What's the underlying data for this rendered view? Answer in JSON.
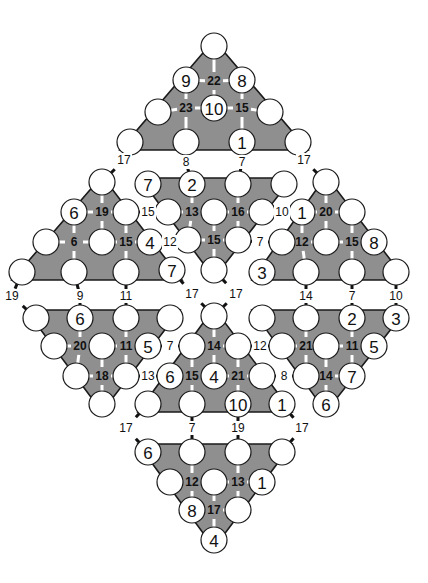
{
  "colors": {
    "shade": "#8f8f8f",
    "outline": "#1a1a1a",
    "circle": "#ffffff",
    "text": "#111111"
  },
  "triangles": [
    {
      "id": "top",
      "points": [
        [
          214,
          40
        ],
        [
          120,
          150
        ],
        [
          308,
          150
        ]
      ]
    },
    {
      "id": "mid-top",
      "points": [
        [
          140,
          178
        ],
        [
          292,
          178
        ],
        [
          214,
          278
        ]
      ]
    },
    {
      "id": "left",
      "points": [
        [
          102,
          176
        ],
        [
          12,
          280
        ],
        [
          182,
          280
        ]
      ]
    },
    {
      "id": "right",
      "points": [
        [
          326,
          176
        ],
        [
          252,
          280
        ],
        [
          406,
          280
        ]
      ]
    },
    {
      "id": "lower-left",
      "points": [
        [
          26,
          310
        ],
        [
          180,
          310
        ],
        [
          102,
          412
        ]
      ]
    },
    {
      "id": "lower-mid",
      "points": [
        [
          214,
          308
        ],
        [
          138,
          412
        ],
        [
          292,
          412
        ]
      ]
    },
    {
      "id": "lower-right",
      "points": [
        [
          252,
          310
        ],
        [
          406,
          310
        ],
        [
          326,
          412
        ]
      ]
    },
    {
      "id": "bottom",
      "points": [
        [
          138,
          444
        ],
        [
          292,
          444
        ],
        [
          214,
          548
        ]
      ]
    }
  ],
  "circles": [
    {
      "x": 214,
      "y": 46,
      "v": ""
    },
    {
      "x": 186,
      "y": 80,
      "v": "9"
    },
    {
      "x": 242,
      "y": 80,
      "v": "8"
    },
    {
      "x": 158,
      "y": 112,
      "v": ""
    },
    {
      "x": 214,
      "y": 108,
      "v": "10"
    },
    {
      "x": 270,
      "y": 112,
      "v": ""
    },
    {
      "x": 130,
      "y": 142,
      "v": ""
    },
    {
      "x": 186,
      "y": 142,
      "v": ""
    },
    {
      "x": 242,
      "y": 142,
      "v": "1"
    },
    {
      "x": 298,
      "y": 142,
      "v": ""
    },
    {
      "x": 148,
      "y": 184,
      "v": "7"
    },
    {
      "x": 192,
      "y": 184,
      "v": "2"
    },
    {
      "x": 238,
      "y": 184,
      "v": ""
    },
    {
      "x": 284,
      "y": 184,
      "v": ""
    },
    {
      "x": 168,
      "y": 212,
      "v": ""
    },
    {
      "x": 214,
      "y": 212,
      "v": ""
    },
    {
      "x": 262,
      "y": 212,
      "v": ""
    },
    {
      "x": 188,
      "y": 240,
      "v": ""
    },
    {
      "x": 238,
      "y": 240,
      "v": ""
    },
    {
      "x": 214,
      "y": 270,
      "v": ""
    },
    {
      "x": 102,
      "y": 182,
      "v": ""
    },
    {
      "x": 74,
      "y": 212,
      "v": "6"
    },
    {
      "x": 126,
      "y": 212,
      "v": ""
    },
    {
      "x": 46,
      "y": 242,
      "v": ""
    },
    {
      "x": 102,
      "y": 242,
      "v": ""
    },
    {
      "x": 150,
      "y": 242,
      "v": "4"
    },
    {
      "x": 22,
      "y": 272,
      "v": ""
    },
    {
      "x": 74,
      "y": 272,
      "v": ""
    },
    {
      "x": 126,
      "y": 272,
      "v": ""
    },
    {
      "x": 172,
      "y": 270,
      "v": "7"
    },
    {
      "x": 326,
      "y": 182,
      "v": ""
    },
    {
      "x": 302,
      "y": 212,
      "v": "1"
    },
    {
      "x": 352,
      "y": 212,
      "v": ""
    },
    {
      "x": 282,
      "y": 242,
      "v": ""
    },
    {
      "x": 326,
      "y": 242,
      "v": ""
    },
    {
      "x": 374,
      "y": 242,
      "v": "8"
    },
    {
      "x": 262,
      "y": 272,
      "v": "3"
    },
    {
      "x": 306,
      "y": 272,
      "v": ""
    },
    {
      "x": 352,
      "y": 272,
      "v": ""
    },
    {
      "x": 396,
      "y": 272,
      "v": ""
    },
    {
      "x": 36,
      "y": 318,
      "v": ""
    },
    {
      "x": 80,
      "y": 318,
      "v": "6"
    },
    {
      "x": 126,
      "y": 318,
      "v": ""
    },
    {
      "x": 170,
      "y": 318,
      "v": ""
    },
    {
      "x": 54,
      "y": 346,
      "v": ""
    },
    {
      "x": 102,
      "y": 346,
      "v": ""
    },
    {
      "x": 148,
      "y": 346,
      "v": "5"
    },
    {
      "x": 76,
      "y": 376,
      "v": ""
    },
    {
      "x": 126,
      "y": 376,
      "v": ""
    },
    {
      "x": 102,
      "y": 404,
      "v": ""
    },
    {
      "x": 214,
      "y": 316,
      "v": ""
    },
    {
      "x": 192,
      "y": 346,
      "v": ""
    },
    {
      "x": 238,
      "y": 346,
      "v": ""
    },
    {
      "x": 170,
      "y": 376,
      "v": "6"
    },
    {
      "x": 214,
      "y": 376,
      "v": "4"
    },
    {
      "x": 262,
      "y": 376,
      "v": ""
    },
    {
      "x": 148,
      "y": 404,
      "v": ""
    },
    {
      "x": 192,
      "y": 404,
      "v": ""
    },
    {
      "x": 238,
      "y": 404,
      "v": "10"
    },
    {
      "x": 282,
      "y": 404,
      "v": "1"
    },
    {
      "x": 262,
      "y": 318,
      "v": ""
    },
    {
      "x": 306,
      "y": 318,
      "v": ""
    },
    {
      "x": 352,
      "y": 318,
      "v": "2"
    },
    {
      "x": 396,
      "y": 318,
      "v": "3"
    },
    {
      "x": 282,
      "y": 346,
      "v": ""
    },
    {
      "x": 326,
      "y": 346,
      "v": ""
    },
    {
      "x": 374,
      "y": 346,
      "v": "5"
    },
    {
      "x": 306,
      "y": 376,
      "v": ""
    },
    {
      "x": 352,
      "y": 376,
      "v": "7"
    },
    {
      "x": 326,
      "y": 404,
      "v": "6"
    },
    {
      "x": 148,
      "y": 452,
      "v": "6"
    },
    {
      "x": 192,
      "y": 452,
      "v": ""
    },
    {
      "x": 238,
      "y": 452,
      "v": ""
    },
    {
      "x": 282,
      "y": 452,
      "v": ""
    },
    {
      "x": 170,
      "y": 482,
      "v": ""
    },
    {
      "x": 214,
      "y": 482,
      "v": ""
    },
    {
      "x": 262,
      "y": 482,
      "v": "1"
    },
    {
      "x": 192,
      "y": 510,
      "v": "8"
    },
    {
      "x": 238,
      "y": 510,
      "v": ""
    },
    {
      "x": 214,
      "y": 540,
      "v": "4"
    }
  ],
  "inner_sums": [
    {
      "x": 214,
      "y": 81,
      "v": "22"
    },
    {
      "x": 186,
      "y": 108,
      "v": "23"
    },
    {
      "x": 242,
      "y": 108,
      "v": "15"
    },
    {
      "x": 192,
      "y": 212,
      "v": "13"
    },
    {
      "x": 238,
      "y": 212,
      "v": "16"
    },
    {
      "x": 214,
      "y": 240,
      "v": "15"
    },
    {
      "x": 102,
      "y": 212,
      "v": "19"
    },
    {
      "x": 74,
      "y": 242,
      "v": "6"
    },
    {
      "x": 126,
      "y": 242,
      "v": "15"
    },
    {
      "x": 326,
      "y": 212,
      "v": "20"
    },
    {
      "x": 302,
      "y": 242,
      "v": "12"
    },
    {
      "x": 352,
      "y": 242,
      "v": "15"
    },
    {
      "x": 80,
      "y": 346,
      "v": "20"
    },
    {
      "x": 126,
      "y": 346,
      "v": "11"
    },
    {
      "x": 102,
      "y": 376,
      "v": "18"
    },
    {
      "x": 214,
      "y": 346,
      "v": "14"
    },
    {
      "x": 192,
      "y": 376,
      "v": "15"
    },
    {
      "x": 238,
      "y": 376,
      "v": "21"
    },
    {
      "x": 306,
      "y": 346,
      "v": "21"
    },
    {
      "x": 352,
      "y": 346,
      "v": "11"
    },
    {
      "x": 326,
      "y": 376,
      "v": "14"
    },
    {
      "x": 192,
      "y": 482,
      "v": "12"
    },
    {
      "x": 238,
      "y": 482,
      "v": "13"
    },
    {
      "x": 214,
      "y": 510,
      "v": "17"
    }
  ],
  "link_sums": [
    {
      "x": 186,
      "y": 162,
      "v": "8"
    },
    {
      "x": 242,
      "y": 162,
      "v": "7"
    },
    {
      "x": 124,
      "y": 160,
      "v": "17"
    },
    {
      "x": 304,
      "y": 160,
      "v": "17"
    },
    {
      "x": 148,
      "y": 212,
      "v": "15"
    },
    {
      "x": 282,
      "y": 212,
      "v": "10"
    },
    {
      "x": 170,
      "y": 242,
      "v": "12"
    },
    {
      "x": 260,
      "y": 242,
      "v": "7"
    },
    {
      "x": 12,
      "y": 296,
      "v": "19"
    },
    {
      "x": 80,
      "y": 296,
      "v": "9"
    },
    {
      "x": 126,
      "y": 296,
      "v": "11"
    },
    {
      "x": 192,
      "y": 294,
      "v": "17"
    },
    {
      "x": 236,
      "y": 294,
      "v": "17"
    },
    {
      "x": 306,
      "y": 296,
      "v": "14"
    },
    {
      "x": 352,
      "y": 296,
      "v": "7"
    },
    {
      "x": 396,
      "y": 296,
      "v": "10"
    },
    {
      "x": 170,
      "y": 346,
      "v": "7"
    },
    {
      "x": 260,
      "y": 346,
      "v": "12"
    },
    {
      "x": 148,
      "y": 376,
      "v": "13"
    },
    {
      "x": 284,
      "y": 376,
      "v": "8"
    },
    {
      "x": 126,
      "y": 428,
      "v": "17"
    },
    {
      "x": 192,
      "y": 428,
      "v": "7"
    },
    {
      "x": 238,
      "y": 428,
      "v": "19"
    },
    {
      "x": 302,
      "y": 428,
      "v": "17"
    }
  ],
  "radius": 13
}
